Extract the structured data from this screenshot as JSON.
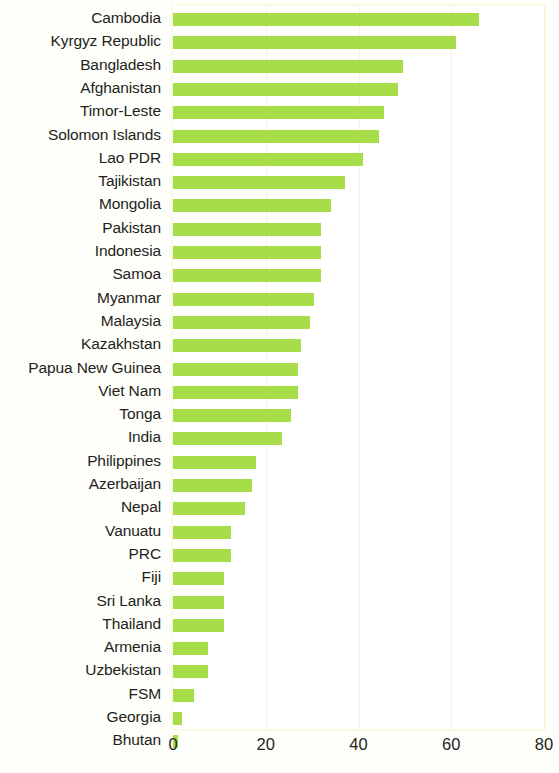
{
  "chart_data": {
    "type": "bar",
    "orientation": "horizontal",
    "title": "",
    "subtitle": "",
    "xlabel": "",
    "ylabel": "",
    "xlim": [
      0,
      80
    ],
    "xticks": [
      0,
      20,
      40,
      60,
      80
    ],
    "xtick_labels": [
      "0",
      "20",
      "40",
      "60",
      "80"
    ],
    "grid": "vertical",
    "legend": "none",
    "bar_color": "#a8dd4a",
    "gridline_color": "#f3f4d8",
    "frame_color": "#fafbe4",
    "categories": [
      "Cambodia",
      "Kyrgyz Republic",
      "Bangladesh",
      "Afghanistan",
      "Timor-Leste",
      "Solomon Islands",
      "Lao PDR",
      "Tajikistan",
      "Mongolia",
      "Pakistan",
      "Indonesia",
      "Samoa",
      "Myanmar",
      "Malaysia",
      "Kazakhstan",
      "Papua New Guinea",
      "Viet Nam",
      "Tonga",
      "India",
      "Philippines",
      "Azerbaijan",
      "Nepal",
      "Vanuatu",
      "PRC",
      "Fiji",
      "Sri Lanka",
      "Thailand",
      "Armenia",
      "Uzbekistan",
      "FSM",
      "Georgia",
      "Bhutan"
    ],
    "values": [
      66.0,
      61.0,
      49.5,
      48.5,
      45.5,
      44.5,
      41.0,
      37.0,
      34.0,
      32.0,
      32.0,
      32.0,
      30.5,
      29.5,
      27.5,
      27.0,
      27.0,
      25.5,
      23.5,
      18.0,
      17.0,
      15.5,
      12.5,
      12.5,
      11.0,
      11.0,
      11.0,
      7.5,
      7.5,
      4.5,
      2.0,
      1.0
    ]
  }
}
